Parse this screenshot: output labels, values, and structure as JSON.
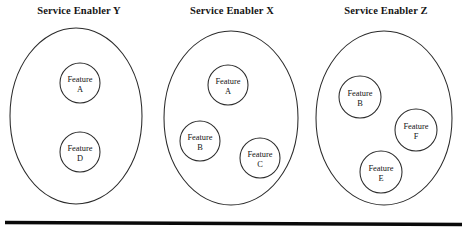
{
  "diagram": {
    "type": "venn-grouping",
    "title_row_y": 12,
    "background_color": "#ffffff",
    "stroke_color": "#2b2b2b",
    "text_color": "#141414",
    "rule_color": "#0a0a0a",
    "feature_word": "Feature",
    "groups": [
      {
        "name": "service-enabler-y",
        "title": "Service Enabler Y",
        "title_x": 79,
        "title_y": 12,
        "ellipse": {
          "cx": 76,
          "cy": 116,
          "rx": 66,
          "ry": 88
        },
        "features": [
          {
            "id": "A",
            "label": "Feature",
            "cx": 80,
            "cy": 83,
            "r": 20
          },
          {
            "id": "D",
            "label": "Feature",
            "cx": 80,
            "cy": 152,
            "r": 20
          }
        ]
      },
      {
        "name": "service-enabler-x",
        "title": "Service Enabler X",
        "title_x": 232,
        "title_y": 12,
        "ellipse": {
          "cx": 231,
          "cy": 118,
          "rx": 67,
          "ry": 87
        },
        "features": [
          {
            "id": "A",
            "label": "Feature",
            "cx": 228,
            "cy": 85,
            "r": 20
          },
          {
            "id": "B",
            "label": "Feature",
            "cx": 200,
            "cy": 141,
            "r": 20
          },
          {
            "id": "C",
            "label": "Feature",
            "cx": 260,
            "cy": 158,
            "r": 20
          }
        ]
      },
      {
        "name": "service-enabler-z",
        "title": "Service Enabler Z",
        "title_x": 386,
        "title_y": 12,
        "ellipse": {
          "cx": 384,
          "cy": 118,
          "rx": 68,
          "ry": 87
        },
        "features": [
          {
            "id": "B",
            "label": "Feature",
            "cx": 360,
            "cy": 97,
            "r": 21
          },
          {
            "id": "F",
            "label": "Feature",
            "cx": 416,
            "cy": 130,
            "r": 21
          },
          {
            "id": "E",
            "label": "Feature",
            "cx": 381,
            "cy": 172,
            "r": 21
          }
        ]
      }
    ],
    "baseline_rule": {
      "x1": 5,
      "y1": 222.5,
      "x2": 462,
      "y2": 224.5
    }
  }
}
